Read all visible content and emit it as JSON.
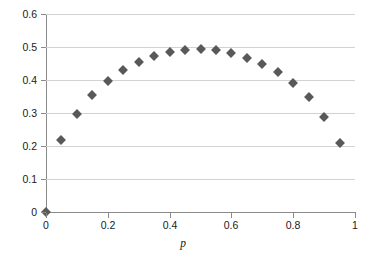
{
  "chart_data": {
    "type": "scatter",
    "title": "",
    "xlabel": "p",
    "ylabel": "Variance",
    "xlim": [
      0,
      1
    ],
    "ylim": [
      0,
      0.6
    ],
    "grid": true,
    "legend": false,
    "marker": {
      "shape": "diamond",
      "color": "#595959",
      "size_px": 7
    },
    "xticks": [
      "0",
      "0.2",
      "0.4",
      "0.6",
      "0.8",
      "1"
    ],
    "xtick_values": [
      0,
      0.2,
      0.4,
      0.6,
      0.8,
      1
    ],
    "yticks": [
      "0",
      "0.1",
      "0.2",
      "0.3",
      "0.4",
      "0.5",
      "0.6"
    ],
    "ytick_values": [
      0,
      0.1,
      0.2,
      0.3,
      0.4,
      0.5,
      0.6
    ],
    "x": [
      0,
      0.05,
      0.1,
      0.15,
      0.2,
      0.25,
      0.3,
      0.35,
      0.4,
      0.45,
      0.5,
      0.55,
      0.6,
      0.65,
      0.7,
      0.75,
      0.8,
      0.85,
      0.9,
      0.95
    ],
    "values": [
      0,
      0.217,
      0.298,
      0.355,
      0.397,
      0.429,
      0.455,
      0.472,
      0.484,
      0.491,
      0.494,
      0.491,
      0.483,
      0.468,
      0.449,
      0.424,
      0.391,
      0.347,
      0.289,
      0.208
    ],
    "series": [
      {
        "name": "Variance",
        "values": [
          0,
          0.217,
          0.298,
          0.355,
          0.397,
          0.429,
          0.455,
          0.472,
          0.484,
          0.491,
          0.494,
          0.491,
          0.483,
          0.468,
          0.449,
          0.424,
          0.391,
          0.347,
          0.289,
          0.208
        ]
      }
    ],
    "colors": {
      "marker": "#595959",
      "gridline": "#d2d2d2",
      "axis": "#8a8a8a",
      "text": "#1a1a1a",
      "background": "#ffffff"
    }
  }
}
